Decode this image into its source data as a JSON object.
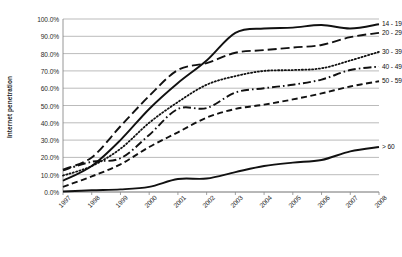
{
  "chart_data": {
    "type": "line",
    "title": "",
    "xlabel": "",
    "ylabel": "Internet penetration",
    "grid": true,
    "legend_position": "right-inline-end-labels",
    "x": [
      "1997",
      "1998",
      "1999",
      "2000",
      "2001",
      "2002",
      "2003",
      "2004",
      "2005",
      "2006",
      "2007",
      "2008"
    ],
    "ylim": [
      0,
      100
    ],
    "ytick_labels": [
      "100.0%",
      "90.0%",
      "80.0%",
      "70.0%",
      "60.0%",
      "50.0%",
      "40.0%",
      "30.0%",
      "20.0%",
      "10.0%",
      "0.0%"
    ],
    "ytick_values": [
      100,
      90,
      80,
      70,
      60,
      50,
      40,
      30,
      20,
      10,
      0
    ],
    "series": [
      {
        "name": "14 - 19",
        "style": "solid",
        "values": [
          6.5,
          15.0,
          30.0,
          48.0,
          63.0,
          76.0,
          92.0,
          94.5,
          95.0,
          96.5,
          94.5,
          97.0
        ]
      },
      {
        "name": "20 - 29",
        "style": "long-dash",
        "values": [
          13.0,
          20.0,
          38.0,
          55.5,
          70.5,
          74.5,
          80.5,
          82.0,
          83.5,
          85.0,
          89.5,
          92.0
        ]
      },
      {
        "name": "30 - 39",
        "style": "dotted",
        "values": [
          9.5,
          15.0,
          25.0,
          40.0,
          52.0,
          62.0,
          67.0,
          70.0,
          70.5,
          71.5,
          76.0,
          81.0
        ]
      },
      {
        "name": "40 - 49",
        "style": "dash-dot",
        "values": [
          12.5,
          17.5,
          19.5,
          33.0,
          48.0,
          48.5,
          57.5,
          60.0,
          62.0,
          65.0,
          70.5,
          72.5
        ]
      },
      {
        "name": "50 - 59",
        "style": "dashed",
        "values": [
          3.0,
          9.0,
          16.0,
          26.0,
          34.5,
          43.0,
          48.0,
          50.5,
          53.5,
          57.0,
          61.0,
          64.0
        ]
      },
      {
        "name": "> 60",
        "style": "solid",
        "values": [
          0.3,
          1.0,
          1.5,
          3.0,
          7.5,
          7.8,
          11.5,
          15.0,
          17.0,
          18.5,
          23.5,
          26.0
        ]
      }
    ]
  }
}
